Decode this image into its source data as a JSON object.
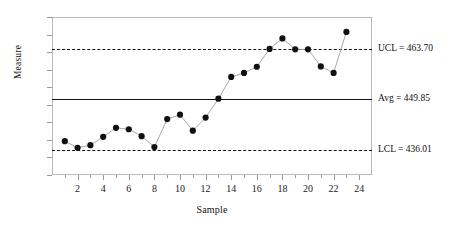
{
  "chart_data": {
    "type": "line",
    "title": "",
    "xlabel": "Sample",
    "ylabel": "Measure",
    "x": [
      1,
      2,
      3,
      4,
      5,
      6,
      7,
      8,
      9,
      10,
      11,
      12,
      13,
      14,
      15,
      16,
      17,
      18,
      19,
      20,
      21,
      22,
      23
    ],
    "values": [
      438.3,
      436.5,
      437.2,
      439.5,
      442.0,
      441.6,
      439.7,
      436.7,
      444.4,
      445.6,
      441.2,
      444.8,
      450.0,
      456.0,
      457.1,
      458.8,
      463.7,
      466.6,
      463.6,
      463.6,
      458.9,
      457.1,
      468.4
    ],
    "xlim": [
      0,
      25
    ],
    "ylim": [
      429.0,
      472.5
    ],
    "xticks_major": [
      2,
      4,
      6,
      8,
      10,
      12,
      14,
      16,
      18,
      20,
      22,
      24
    ],
    "xtick_labels": [
      "2",
      "4",
      "6",
      "8",
      "10",
      "12",
      "14",
      "16",
      "18",
      "20",
      "22",
      "24"
    ],
    "grid": false,
    "legend": "none",
    "marker": "filled-circle",
    "line_color": "#9e9e9e",
    "marker_color": "#111111",
    "reference_lines": [
      {
        "name": "UCL",
        "label": "UCL = 463.70",
        "value": 463.7,
        "style": "dashed"
      },
      {
        "name": "Avg",
        "label": "Avg = 449.85",
        "value": 449.85,
        "style": "solid"
      },
      {
        "name": "LCL",
        "label": "LCL = 436.01",
        "value": 436.01,
        "style": "dashed"
      }
    ]
  }
}
